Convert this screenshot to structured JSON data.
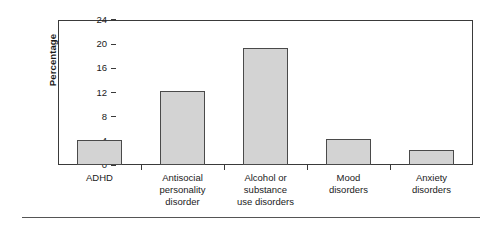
{
  "chart_data": {
    "type": "bar",
    "title": "",
    "subtitle": "",
    "xlabel": "",
    "ylabel": "Percentage",
    "ylim": [
      0,
      24
    ],
    "yticks": [
      0,
      4,
      8,
      12,
      16,
      20,
      24
    ],
    "ytick_labels": [
      "0",
      "4",
      "8",
      "12",
      "16",
      "20",
      "24"
    ],
    "grid": false,
    "legend": null,
    "legend_position": "none",
    "categories": [
      "ADHD",
      "Antisocial personality disorder",
      "Alcohol or substance use disorders",
      "Mood disorders",
      "Anxiety disorders"
    ],
    "category_label_lines": [
      [
        "ADHD"
      ],
      [
        "Antisocial",
        "personality",
        "disorder"
      ],
      [
        "Alcohol or",
        "substance",
        "use disorders"
      ],
      [
        "Mood",
        "disorders"
      ],
      [
        "Anxiety",
        "disorders"
      ]
    ],
    "values": [
      4.1,
      12.2,
      19.4,
      4.3,
      2.5
    ],
    "bar_fill_color": "#d3d3d3",
    "bar_edge_color": "#4a4a4a",
    "axis_color": "#3a3a3a",
    "background_color": "#ffffff"
  },
  "figure": {
    "y_axis_title": "Percentage",
    "rule_color": "#555555"
  }
}
